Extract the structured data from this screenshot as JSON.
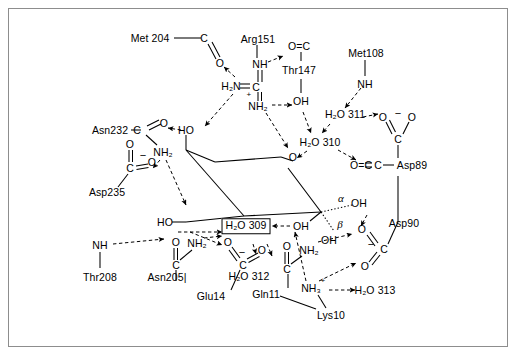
{
  "figure": {
    "type": "molecular-interaction-diagram",
    "border_color": "#8d8d8d",
    "background": "#ffffff",
    "line_color": "#000000"
  },
  "ligand": {
    "name": "pyranose-ring",
    "ring_atom_label": "O",
    "hydroxyls": [
      "HO",
      "HO",
      "HO",
      "OH",
      "OH"
    ],
    "anomeric": {
      "alpha": "α",
      "beta": "β"
    }
  },
  "residues": [
    {
      "id": "met204",
      "label": "Met 204"
    },
    {
      "id": "arg151",
      "label": "Arg151"
    },
    {
      "id": "thr147",
      "label": "Thr147"
    },
    {
      "id": "met108",
      "label": "Met108"
    },
    {
      "id": "asn232",
      "label": "Asn232"
    },
    {
      "id": "asp235",
      "label": "Asp235"
    },
    {
      "id": "asp89",
      "label": "Asp89"
    },
    {
      "id": "asp90",
      "label": "Asp90"
    },
    {
      "id": "thr208",
      "label": "Thr208"
    },
    {
      "id": "asn205",
      "label": "Asn205|"
    },
    {
      "id": "glu14",
      "label": "Glu14"
    },
    {
      "id": "gln11",
      "label": "Gln11"
    },
    {
      "id": "lys10",
      "label": "Lys10"
    }
  ],
  "waters": [
    {
      "id": "w309",
      "label": "H₂O 309",
      "boxed": true
    },
    {
      "id": "w310",
      "label": "H₂O 310",
      "boxed": false
    },
    {
      "id": "w311",
      "label": "H₂O 311",
      "boxed": false
    },
    {
      "id": "w312",
      "label": "H₂O 312",
      "boxed": false
    },
    {
      "id": "w313",
      "label": "H₂O 313",
      "boxed": false
    }
  ],
  "atoms": {
    "carbon": "C",
    "oxygen": "O",
    "nitrogen": "N",
    "nh": "NH",
    "nh2": "NH₂",
    "nh3": "NH₃",
    "h2n": "H₂N",
    "oh": "OH",
    "ho": "HO",
    "o_eq_c": "O=C",
    "o_eq_c_asp89": "O=C",
    "charge_minus": "−",
    "charge_plus": "+"
  },
  "labels": {
    "met204_c": "C",
    "met204_o": "O",
    "arg_h2n": "H₂N",
    "arg_c": "C",
    "arg_nh_top": "NH",
    "arg_nh2_bottom": "NH₂",
    "arg_plus": "+",
    "thr147_oec": "O=C",
    "thr147_oh": "OH",
    "met108_nh": "NH",
    "asn232_c": "C",
    "asn232_o": "O",
    "asn232_nh2": "NH₂",
    "asp235_o_top": "O",
    "asp235_c": "C",
    "asp235_o_right": "O",
    "asp235_minus": "−",
    "asp89_o_left": "O",
    "asp89_o_right": "O",
    "asp89_c": "C",
    "asp89_minus": "−",
    "asp89_oec": "O=C",
    "asp90_o_upper": "O",
    "asp90_o_lower": "O",
    "asp90_c": "C",
    "asp90_minus": "−",
    "thr208_nh": "NH",
    "asn205_o": "O",
    "asn205_c": "C",
    "asn205_nh2": "NH₂",
    "glu14_o_up": "O",
    "glu14_o_right": "O",
    "glu14_c": "C",
    "glu14_minus": "−",
    "gln11_o": "O",
    "gln11_c": "C",
    "gln11_nh2": "NH₂",
    "lys10_nh3": "NH₃",
    "lys10_plus": "+",
    "ring_o": "O",
    "ho_top": "HO",
    "ho_left": "HO",
    "ho_right": "OH",
    "oh_alpha": "OH",
    "oh_beta": "OH",
    "alpha": "α",
    "beta": "β"
  }
}
